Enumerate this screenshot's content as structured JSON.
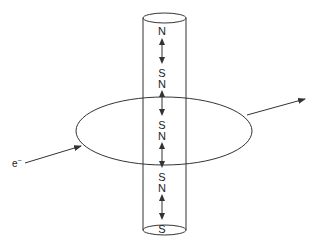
{
  "diagram": {
    "type": "magnetic-domains-cylinder-with-electron-path",
    "pole_labels": [
      "N",
      "S",
      "N",
      "S",
      "N",
      "S",
      "N",
      "S"
    ],
    "electron": {
      "label": "e",
      "charge_superscript": "−"
    },
    "colors": {
      "line": "#333333",
      "text": "#222222",
      "background": "#ffffff"
    }
  }
}
